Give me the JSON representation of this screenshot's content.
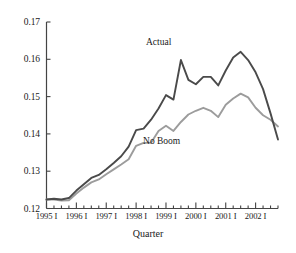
{
  "chart_data": {
    "type": "line",
    "title": "",
    "xlabel": "Quarter",
    "ylabel": "",
    "xlim": [
      0,
      31
    ],
    "ylim": [
      0.12,
      0.17
    ],
    "grid": false,
    "legend_position": "inline-annotation",
    "ytick_labels": [
      "0.17",
      "0.16",
      "0.15",
      "0.14",
      "0.13",
      "0.12"
    ],
    "ytick_values": [
      0.17,
      0.16,
      0.15,
      0.14,
      0.13,
      0.12
    ],
    "xtick_labels": [
      "1995 I",
      "1996 I",
      "1997 I",
      "1998 I",
      "1999 I",
      "2000 I",
      "2001 I",
      "2002 I"
    ],
    "xtick_values": [
      0,
      4,
      8,
      12,
      16,
      20,
      24,
      28
    ],
    "minor_xticks_per_year": 4,
    "x": [
      0,
      1,
      2,
      3,
      4,
      5,
      6,
      7,
      8,
      9,
      10,
      11,
      12,
      13,
      14,
      15,
      16,
      17,
      18,
      19,
      20,
      21,
      22,
      23,
      24,
      25,
      26,
      27,
      28,
      29,
      30,
      31
    ],
    "x_quarter_labels": [
      "1995 I",
      "1995 II",
      "1995 III",
      "1995 IV",
      "1996 I",
      "1996 II",
      "1996 III",
      "1996 IV",
      "1997 I",
      "1997 II",
      "1997 III",
      "1997 IV",
      "1998 I",
      "1998 II",
      "1998 III",
      "1998 IV",
      "1999 I",
      "1999 II",
      "1999 III",
      "1999 IV",
      "2000 I",
      "2000 II",
      "2000 III",
      "2000 IV",
      "2001 I",
      "2001 II",
      "2001 III",
      "2001 IV",
      "2002 I",
      "2002 II",
      "2002 III",
      "2002 IV"
    ],
    "series": [
      {
        "name": "Actual",
        "color": "#4a4a4a",
        "label_x": 16,
        "label_y": 0.1645,
        "values": [
          0.1224,
          0.1226,
          0.1224,
          0.1228,
          0.1248,
          0.1265,
          0.1282,
          0.129,
          0.1305,
          0.1322,
          0.134,
          0.1366,
          0.141,
          0.1414,
          0.1438,
          0.1468,
          0.1504,
          0.1492,
          0.1598,
          0.1545,
          0.1533,
          0.1553,
          0.1553,
          0.153,
          0.157,
          0.1605,
          0.162,
          0.1598,
          0.1565,
          0.152,
          0.1455,
          0.1385
        ],
        "min": 0.1224,
        "max": 0.162,
        "max_at": "2001 III",
        "end": 0.1385
      },
      {
        "name": "No Boom",
        "color": "#9c9c9c",
        "label_x": 14,
        "label_y": 0.1378,
        "values": [
          0.1224,
          0.1224,
          0.1221,
          0.1222,
          0.124,
          0.1256,
          0.127,
          0.1278,
          0.1292,
          0.1305,
          0.1318,
          0.1332,
          0.1368,
          0.1376,
          0.1376,
          0.1408,
          0.1422,
          0.1408,
          0.1432,
          0.1452,
          0.1462,
          0.147,
          0.1462,
          0.1445,
          0.1478,
          0.1495,
          0.1508,
          0.1498,
          0.147,
          0.145,
          0.1438,
          0.142
        ],
        "min": 0.1221,
        "max": 0.1508,
        "max_at": "2001 III",
        "end": 0.142
      }
    ]
  },
  "axis": {
    "x_title": "Quarter"
  }
}
